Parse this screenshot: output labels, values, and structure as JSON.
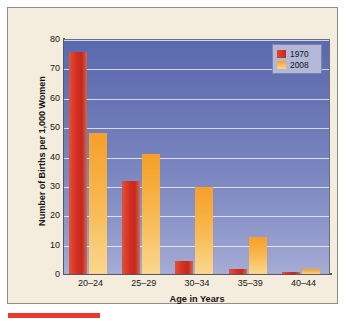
{
  "figure": {
    "background_color": "#f4ecdc",
    "border_color": "#8e8d88",
    "accent_rule_color": "#e8392c"
  },
  "chart_data": {
    "type": "bar",
    "title": "",
    "xlabel": "Age in Years",
    "ylabel": "Number of Births per 1,000 Women",
    "categories": [
      "20–24",
      "25–29",
      "30–34",
      "35–39",
      "40–44"
    ],
    "series": [
      {
        "name": "1970",
        "color": "#d12e22",
        "values": [
          75.5,
          31.5,
          4.5,
          1.7,
          0.7
        ]
      },
      {
        "name": "2008",
        "color": "#f6a02a",
        "values": [
          48.0,
          41.0,
          29.5,
          12.5,
          1.6
        ]
      }
    ],
    "ylim": [
      0,
      80
    ],
    "yticks": [
      0,
      10,
      20,
      30,
      40,
      50,
      60,
      70,
      80
    ],
    "ytick_labels": [
      "0",
      "10",
      "20",
      "30",
      "40",
      "50",
      "60",
      "70",
      "80"
    ],
    "grid": true,
    "grid_orientation": "horizontal",
    "grid_color": "#ffffff",
    "legend_position": "top-right",
    "plot_background": "blue-gradient"
  }
}
